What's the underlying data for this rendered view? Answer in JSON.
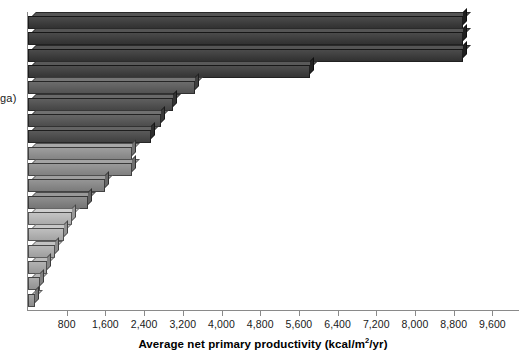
{
  "axis": {
    "y_label_visible_fragment": "ga)",
    "x_title_prefix": "Average net primary productivity (kcal/m",
    "x_title_superscript": "2",
    "x_title_suffix": "/yr)",
    "x_tick_labels": [
      "800",
      "1,600",
      "2,400",
      "3,200",
      "4,000",
      "4,800",
      "5,600",
      "6,400",
      "7,200",
      "8,000",
      "8,800",
      "9,600"
    ],
    "x_tick_values": [
      800,
      1600,
      2400,
      3200,
      4000,
      4800,
      5600,
      6400,
      7200,
      8000,
      8800,
      9600
    ]
  },
  "chart_data": {
    "type": "bar",
    "orientation": "horizontal",
    "title": "",
    "subtitle": "",
    "xlabel": "Average net primary productivity (kcal/m2/yr)",
    "ylabel": "ga)",
    "xlim": [
      0,
      10160
    ],
    "ylim": null,
    "grid": false,
    "legend": null,
    "tick_interval": 800,
    "categories": [
      "",
      "",
      "",
      "",
      "",
      "",
      "",
      "",
      "",
      "",
      "",
      "",
      "",
      "",
      "",
      "",
      "",
      ""
    ],
    "values": [
      9000,
      9000,
      9000,
      5830,
      3450,
      3000,
      2750,
      2550,
      2150,
      2150,
      1600,
      1250,
      900,
      750,
      550,
      400,
      250,
      150
    ],
    "bar_colors": [
      "#3b3b3b",
      "#3b3b3b",
      "#3b3b3b",
      "#3f3f3f",
      "#5c5c5c",
      "#4f4f4f",
      "#565656",
      "#4a4a4a",
      "#8e8e8e",
      "#8a8a8a",
      "#858585",
      "#7f7f7f",
      "#b4b4b4",
      "#aeaeae",
      "#a8a8a8",
      "#a2a2a2",
      "#9c9c9c",
      "#969696"
    ],
    "bar_count": 18,
    "axis_color": "#8a8a8a",
    "background_color": "#ffffff",
    "text_color": "#1a1a1a"
  }
}
